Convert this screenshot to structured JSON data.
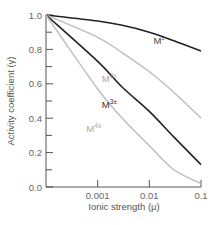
{
  "chart_data": {
    "type": "line",
    "title": "",
    "xlabel": "Ionic strength (μ)",
    "ylabel": "Activity coefficient (γ)",
    "xscale": "log",
    "x_tick_labels": [
      "0.001",
      "0.01",
      "0.1"
    ],
    "y_tick_labels": [
      "0.0",
      "0.2",
      "0.4",
      "0.6",
      "0.8",
      "1.0"
    ],
    "xlim": [
      0.0001,
      0.1
    ],
    "ylim": [
      0.0,
      1.0
    ],
    "grid": false,
    "legend": "inline labels",
    "x": [
      0.0001,
      0.001,
      0.003,
      0.01,
      0.03,
      0.1
    ],
    "series": [
      {
        "name": "M±",
        "label_base": "M",
        "label_sup": "±",
        "color": "#222222",
        "values": [
          1.0,
          0.965,
          0.94,
          0.9,
          0.85,
          0.79
        ]
      },
      {
        "name": "M2±",
        "label_base": "M",
        "label_sup": "2±",
        "color": "#bdbdbd",
        "values": [
          1.0,
          0.87,
          0.78,
          0.67,
          0.55,
          0.4
        ]
      },
      {
        "name": "M3±",
        "label_base": "M",
        "label_sup": "3±",
        "color": "#222222",
        "values": [
          1.0,
          0.73,
          0.58,
          0.44,
          0.29,
          0.13
        ]
      },
      {
        "name": "M4±",
        "label_base": "M",
        "label_sup": "4±",
        "color": "#bdbdbd",
        "values": [
          1.0,
          0.57,
          0.4,
          0.24,
          0.1,
          0.02
        ]
      }
    ],
    "label_positions": [
      {
        "x": 0.012,
        "y": 0.83
      },
      {
        "x": 0.0012,
        "y": 0.61
      },
      {
        "x": 0.0012,
        "y": 0.46
      },
      {
        "x": 0.0006,
        "y": 0.32
      }
    ],
    "label_colors": [
      "#444444",
      "#aaaaaa",
      "#333333",
      "#aaaaaa"
    ]
  }
}
